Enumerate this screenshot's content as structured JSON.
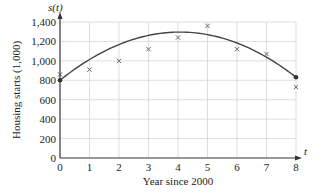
{
  "chart_data": {
    "type": "scatter",
    "title": "",
    "xlabel": "Year since 2000",
    "ylabel": "Housing starts (1,000)",
    "x_axis_symbol": "t",
    "y_axis_symbol": "s(t)",
    "xlim": [
      0,
      8
    ],
    "ylim": [
      0,
      1400
    ],
    "x_ticks": [
      "0",
      "1",
      "2",
      "3",
      "4",
      "5",
      "6",
      "7",
      "8"
    ],
    "y_ticks": [
      "0",
      "200",
      "400",
      "600",
      "800",
      "1,000",
      "1,200",
      "1,400"
    ],
    "grid": true,
    "series": [
      {
        "name": "Observed housing starts",
        "marker": "x",
        "x": [
          0,
          1,
          2,
          3,
          4,
          5,
          6,
          7,
          8
        ],
        "values": [
          860,
          910,
          1000,
          1120,
          1240,
          1360,
          1120,
          1070,
          730
        ]
      },
      {
        "name": "Quadratic model s(t)",
        "type": "line",
        "model": "s(t) = -30t^2 + 244t + 800",
        "coefficients": {
          "a": -30,
          "b": 244,
          "c": 800
        },
        "endpoints": [
          [
            0,
            800
          ],
          [
            8,
            832
          ]
        ]
      }
    ],
    "colors": {
      "curve": "#444444",
      "marker": "#666666",
      "grid": "#d6d6d6",
      "axis": "#333333"
    }
  },
  "labels": {
    "x_axis": "Year since 2000",
    "y_axis": "Housing starts (1,000)",
    "x_symbol": "t",
    "y_symbol": "s(t)"
  }
}
